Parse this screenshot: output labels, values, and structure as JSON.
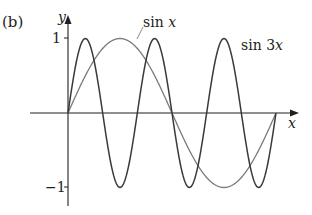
{
  "panel_label": "(b)",
  "chart_data": {
    "type": "line",
    "title": "",
    "xlabel": "x",
    "ylabel": "y",
    "x_range": [
      0,
      6.2832
    ],
    "ylim": [
      -1,
      1
    ],
    "y_ticks": [
      {
        "value": 1,
        "label": "1"
      },
      {
        "value": -1,
        "label": "−1"
      }
    ],
    "grid": false,
    "series": [
      {
        "name": "sin x",
        "label": "sin x",
        "function": "sin(x)",
        "color": "#7a7a7a",
        "x_domain": [
          0,
          6.2832
        ]
      },
      {
        "name": "sin 3x",
        "label": "sin 3x",
        "function": "sin(3x)",
        "color": "#3a3a3a",
        "x_domain": [
          0,
          6.2832
        ]
      }
    ]
  },
  "labels": {
    "sinx_func": "sin",
    "sinx_var": "x",
    "sin3x_func": "sin 3",
    "sin3x_var": "x",
    "x_axis": "x",
    "y_axis": "y",
    "tick_pos": "1",
    "tick_neg": "−1"
  }
}
